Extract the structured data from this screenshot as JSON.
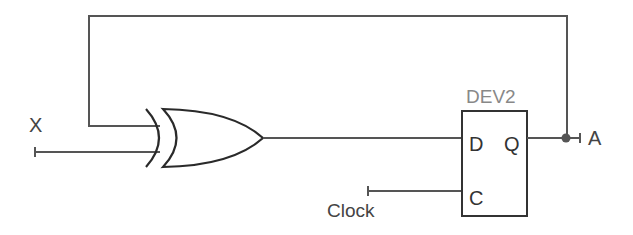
{
  "diagram": {
    "type": "logic-circuit",
    "inputs": [
      {
        "name": "X",
        "label": "X"
      },
      {
        "name": "Clock",
        "label": "Clock"
      }
    ],
    "outputs": [
      {
        "name": "A",
        "label": "A"
      }
    ],
    "gates": [
      {
        "id": "xor1",
        "type": "XOR",
        "inputs": [
          "A",
          "X"
        ],
        "output": "D"
      }
    ],
    "devices": [
      {
        "id": "DEV2",
        "label": "DEV2",
        "type": "D flip-flop",
        "pins": {
          "d": "D",
          "q": "Q",
          "c": "C"
        }
      }
    ],
    "connections": [
      "Q -> A (output)",
      "Q -> XOR input 1 (feedback)",
      "X -> XOR input 2",
      "XOR output -> D",
      "Clock -> C"
    ],
    "colors": {
      "wire": "#555555",
      "gate": "#2a2a2a",
      "device_label": "#888888"
    }
  }
}
